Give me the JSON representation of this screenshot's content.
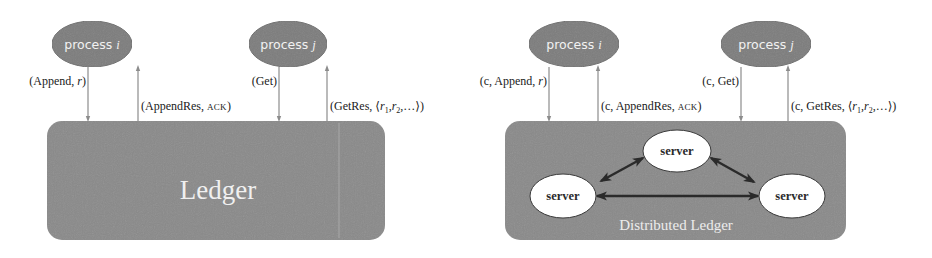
{
  "colors": {
    "background": "#ffffff",
    "ellipse_fill": "#7d7d7d",
    "ellipse_text": "#f2f2f2",
    "ledger_fill": "#8a8a8a",
    "arrow_thin": "#8c8c8c",
    "server_fill": "#ffffff",
    "server_stroke": "#3a3a3a",
    "server_link": "#2a2a2a",
    "message_text": "#1a1a1a"
  },
  "left_diagram": {
    "process_i": {
      "label": "process",
      "var": "i"
    },
    "process_j": {
      "label": "process",
      "var": "j"
    },
    "messages": {
      "append": {
        "open": "(Append, ",
        "var": "r",
        "close": ")"
      },
      "append_res": {
        "open": "(AppendRes, ",
        "sc": "ACK",
        "close": ")"
      },
      "get": {
        "text": "(Get)"
      },
      "get_res": {
        "open": "(GetRes, ⟨",
        "r1": "r",
        "sub1": "1",
        "sep": ",",
        "r2": "r",
        "sub2": "2",
        "close": ",…⟩)"
      }
    },
    "ledger": {
      "label": "Ledger"
    }
  },
  "right_diagram": {
    "process_i": {
      "label": "process",
      "var": "i"
    },
    "process_j": {
      "label": "process",
      "var": "j"
    },
    "messages": {
      "append": {
        "open": "(c, Append, ",
        "var": "r",
        "close": ")"
      },
      "append_res": {
        "open": "(c, AppendRes, ",
        "sc": "ACK",
        "close": ")"
      },
      "get": {
        "text": "(c, Get)"
      },
      "get_res": {
        "open": "(c, GetRes, ⟨",
        "r1": "r",
        "sub1": "1",
        "sep": ",",
        "r2": "r",
        "sub2": "2",
        "close": ",…⟩)"
      }
    },
    "servers": [
      {
        "label": "server",
        "position": "top"
      },
      {
        "label": "server",
        "position": "left"
      },
      {
        "label": "server",
        "position": "right"
      }
    ],
    "ledger": {
      "label": "Distributed Ledger"
    }
  }
}
